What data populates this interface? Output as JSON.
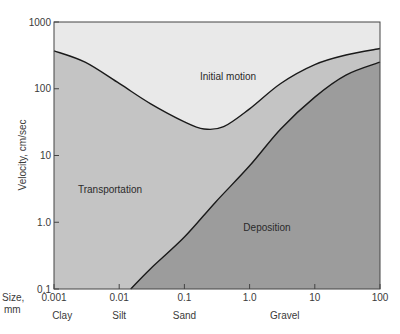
{
  "chart_data": {
    "type": "area",
    "title": "",
    "xlabel": "Size, mm",
    "ylabel": "Velocity, cm/sec",
    "xscale": "log",
    "yscale": "log",
    "xlim": [
      0.001,
      100
    ],
    "ylim": [
      0.1,
      1000
    ],
    "x_ticks": [
      "0.001",
      "0.01",
      "0.1",
      "1.0",
      "10",
      "100"
    ],
    "y_ticks": [
      "0.1",
      "1.0",
      "10",
      "100",
      "1000"
    ],
    "size_classes": [
      "Clay",
      "Silt",
      "Sand",
      "Gravel"
    ],
    "regions": [
      "Initial motion",
      "Transportation",
      "Deposition"
    ],
    "series": [
      {
        "name": "Initial motion threshold (erosion curve)",
        "x": [
          0.001,
          0.003,
          0.01,
          0.03,
          0.1,
          0.2,
          0.4,
          1.0,
          3.0,
          10,
          30,
          100
        ],
        "values": [
          370,
          250,
          120,
          60,
          32,
          25,
          27,
          50,
          120,
          230,
          320,
          400
        ]
      },
      {
        "name": "Deposition threshold (settling curve)",
        "x": [
          0.015,
          0.03,
          0.1,
          0.3,
          1.0,
          3.0,
          10,
          30,
          100
        ],
        "values": [
          0.1,
          0.2,
          0.6,
          2.0,
          7.0,
          25,
          75,
          160,
          250
        ]
      }
    ],
    "grid": false,
    "legend": "none (regions labeled in-plot)"
  },
  "colors": {
    "initial_motion": "#e9e9e9",
    "transportation": "#c4c4c4",
    "deposition": "#9c9c9c",
    "curve": "#1a1a1a"
  }
}
